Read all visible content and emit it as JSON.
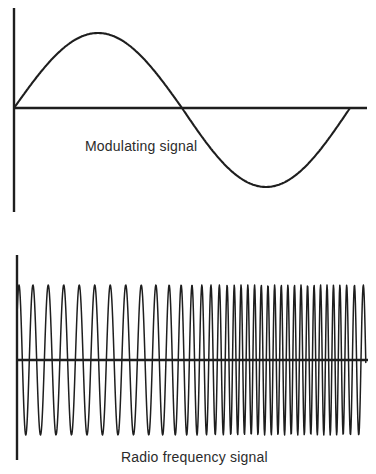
{
  "figure": {
    "background": "#ffffff",
    "line_color": "#1e1e1e",
    "text_color": "#2b2b2b",
    "panels": {
      "modulating": {
        "label": "Modulating signal",
        "signal_type": "sine",
        "cycles": 1,
        "axis": {
          "x": 14,
          "y_top": 8,
          "y_bottom": 212,
          "baseline_y": 108,
          "x_end": 367
        },
        "wave": {
          "x_start": 14,
          "x_end": 350,
          "period": 336,
          "amp_up": 75,
          "amp_down": 79
        }
      },
      "rf": {
        "label": "Radio frequency signal",
        "signal_type": "chirp",
        "axis": {
          "x": 17,
          "y_top": 255,
          "y_bottom": 460,
          "baseline_y": 360,
          "x_end": 368
        },
        "wave": {
          "x_start": 17,
          "x_end": 366,
          "amplitude": 75,
          "phase0_deg": 35,
          "period_px_points": [
            [
              17,
              13
            ],
            [
              40,
              15.5
            ],
            [
              140,
              15.5
            ],
            [
              195,
              10
            ],
            [
              235,
              6.8
            ],
            [
              340,
              6.4
            ],
            [
              367,
              10
            ]
          ]
        }
      }
    }
  },
  "chart_data": [
    {
      "type": "line",
      "title": "Modulating signal",
      "description": "One full sine cycle starting at the axis origin: rises to a positive peak, crosses zero mid-way, dips to a negative trough, returns to the baseline. No tick marks, scales or numeric labels.",
      "x_range_px": [
        14,
        350
      ],
      "baseline_y_px": 108,
      "amplitude_up_px": 75,
      "amplitude_down_px": 79,
      "cycles": 1
    },
    {
      "type": "line",
      "title": "Radio frequency signal",
      "description": "Constant-amplitude oscillation whose frequency increases from left (period ~15.5 px) to right (period ~6.5 px), approximately 37 cycles total, drawn about a horizontal baseline. No tick marks, scales or numeric labels.",
      "x_range_px": [
        17,
        366
      ],
      "baseline_y_px": 360,
      "amplitude_px": 75,
      "cycles_approx": 37,
      "period_px_left": 15.5,
      "period_px_right": 6.5
    }
  ]
}
